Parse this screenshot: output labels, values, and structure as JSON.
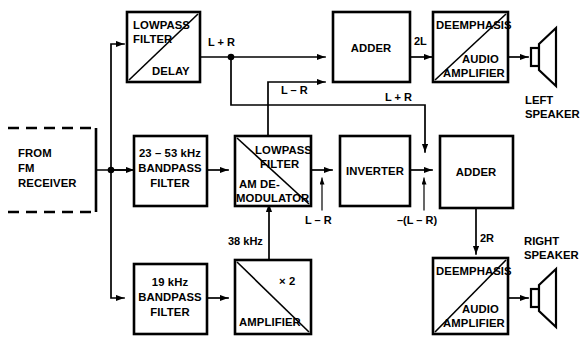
{
  "diagram": {
    "colors": {
      "line": "#000000",
      "background": "#ffffff",
      "fill": "#ffffff"
    },
    "blocks": {
      "source": {
        "line1": "FROM",
        "line2": "FM",
        "line3": "RECEIVER",
        "border": "dashed"
      },
      "lowpass_delay": {
        "line1": "LOWPASS",
        "line2": "FILTER",
        "line3": "DELAY"
      },
      "bandpass_23_53": {
        "line1": "23 – 53 kHz",
        "line2": "BANDPASS",
        "line3": "FILTER"
      },
      "bandpass_19": {
        "line1": "19 kHz",
        "line2": "BANDPASS",
        "line3": "FILTER"
      },
      "am_demod": {
        "line1": "LOWPASS",
        "line2": "FILTER",
        "line3": "AM DE-",
        "line4": "MODULATOR"
      },
      "amplifier_x2": {
        "line1": "× 2",
        "line2": "AMPLIFIER"
      },
      "adder_top": {
        "label": "ADDER"
      },
      "inverter": {
        "label": "INVERTER"
      },
      "adder_bottom": {
        "label": "ADDER"
      },
      "deemph_left": {
        "line1": "DEEMPHASIS",
        "line2": "AUDIO",
        "line3": "AMPLIFIER"
      },
      "deemph_right": {
        "line1": "DEEMPHASIS",
        "line2": "AUDIO",
        "line3": "AMPLIFIER"
      }
    },
    "speakers": {
      "left": {
        "line1": "LEFT",
        "line2": "SPEAKER"
      },
      "right": {
        "line1": "RIGHT",
        "line2": "SPEAKER"
      }
    },
    "signal_labels": {
      "lpr_top": "L + R",
      "lmr_top": "L – R",
      "lpr_mid": "L + R",
      "two_l": "2L",
      "lmr_bottom": "L – R",
      "neg_lmr": "–(L – R)",
      "two_r": "2R",
      "thirty_eight_khz": "38 kHz"
    }
  }
}
